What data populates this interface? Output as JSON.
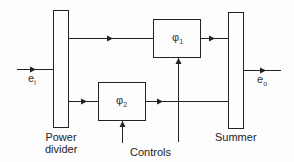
{
  "diagram": {
    "type": "block-diagram",
    "blocks": {
      "power_divider": {
        "label_line1": "Power",
        "label_line2": "divider"
      },
      "summer": {
        "label": "Summer"
      },
      "phi1": {
        "symbol": "φ",
        "subscript": "1"
      },
      "phi2": {
        "symbol": "φ",
        "subscript": "2"
      }
    },
    "signals": {
      "input": {
        "symbol": "e",
        "subscript": "i"
      },
      "output": {
        "symbol": "e",
        "subscript": "o"
      }
    },
    "controls_label": "Controls",
    "colors": {
      "line": "#222222",
      "background": "#fdfdfd"
    }
  }
}
